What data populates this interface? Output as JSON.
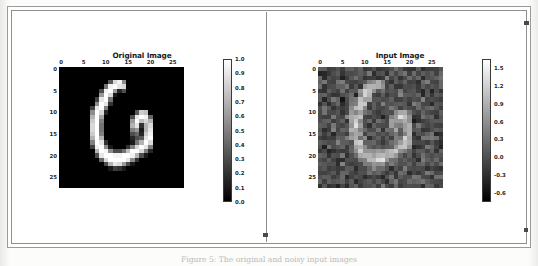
{
  "document": {
    "caption": "Figure 5: The original and noisy input images"
  },
  "figure": {
    "panels": [
      {
        "id": "original",
        "title": "Original Image",
        "xticks": [
          "0",
          "5",
          "10",
          "15",
          "20",
          "25"
        ],
        "yticks": [
          "0",
          "5",
          "10",
          "15",
          "20",
          "25"
        ],
        "colorbar": {
          "ticks": [
            "1.0",
            "0.9",
            "0.8",
            "0.7",
            "0.6",
            "0.5",
            "0.4",
            "0.3",
            "0.2",
            "0.1",
            "0.0"
          ],
          "vmin": 0.0,
          "vmax": 1.0,
          "cmap_low": "#000000",
          "cmap_high": "#ffffff"
        }
      },
      {
        "id": "input",
        "title": "Input Image",
        "xticks": [
          "0",
          "5",
          "10",
          "15",
          "20",
          "25"
        ],
        "yticks": [
          "0",
          "5",
          "10",
          "15",
          "20",
          "25"
        ],
        "colorbar": {
          "ticks": [
            "1.5",
            "1.2",
            "0.9",
            "0.6",
            "0.3",
            "0.0",
            "-0.3",
            "-0.6"
          ],
          "vmin": -0.75,
          "vmax": 1.65,
          "cmap_low": "#000000",
          "cmap_high": "#ffffff"
        }
      }
    ]
  },
  "chart_data": [
    {
      "type": "heatmap",
      "id": "original-image",
      "title": "Original Image",
      "xlabel": "",
      "ylabel": "",
      "cmap": "gray",
      "grid": false,
      "legend": "colorbar-right",
      "xlim": [
        0,
        27
      ],
      "ylim": [
        27,
        0
      ],
      "xticks": [
        0,
        5,
        10,
        15,
        20,
        25
      ],
      "yticks": [
        0,
        5,
        10,
        15,
        20,
        25
      ],
      "colorbar_ticks": [
        1.0,
        0.9,
        0.8,
        0.7,
        0.6,
        0.5,
        0.4,
        0.3,
        0.2,
        0.1,
        0.0
      ],
      "vmin": 0.0,
      "vmax": 1.0,
      "shape": [
        28,
        28
      ],
      "description": "MNIST handwritten digit 6, white strokes on black background",
      "values": [
        [
          0,
          0,
          0,
          0,
          0,
          0,
          0,
          0,
          0,
          0,
          0,
          0,
          0,
          0,
          0,
          0,
          0,
          0,
          0,
          0,
          0,
          0,
          0,
          0,
          0,
          0,
          0,
          0
        ],
        [
          0,
          0,
          0,
          0,
          0,
          0,
          0,
          0,
          0,
          0,
          0,
          0,
          0,
          0,
          0,
          0,
          0,
          0,
          0,
          0,
          0,
          0,
          0,
          0,
          0,
          0,
          0,
          0
        ],
        [
          0,
          0,
          0,
          0,
          0,
          0,
          0,
          0,
          0,
          0,
          0,
          0,
          0,
          0,
          0,
          0,
          0,
          0,
          0,
          0,
          0,
          0,
          0,
          0,
          0,
          0,
          0,
          0
        ],
        [
          0,
          0,
          0,
          0,
          0,
          0,
          0,
          0,
          0,
          0,
          0,
          0.35,
          0.85,
          0.95,
          0.55,
          0,
          0,
          0,
          0,
          0,
          0,
          0,
          0,
          0,
          0,
          0,
          0,
          0
        ],
        [
          0,
          0,
          0,
          0,
          0,
          0,
          0,
          0,
          0,
          0,
          0.45,
          0.95,
          1.0,
          0.9,
          0.85,
          0,
          0,
          0,
          0,
          0,
          0,
          0,
          0,
          0,
          0,
          0,
          0,
          0
        ],
        [
          0,
          0,
          0,
          0,
          0,
          0,
          0,
          0,
          0,
          0.3,
          0.95,
          1.0,
          0.6,
          0.15,
          0.3,
          0,
          0,
          0,
          0,
          0,
          0,
          0,
          0,
          0,
          0,
          0,
          0,
          0
        ],
        [
          0,
          0,
          0,
          0,
          0,
          0,
          0,
          0,
          0,
          0.6,
          1.0,
          0.85,
          0.1,
          0,
          0,
          0,
          0,
          0,
          0,
          0,
          0,
          0,
          0,
          0,
          0,
          0,
          0,
          0
        ],
        [
          0,
          0,
          0,
          0,
          0,
          0,
          0,
          0,
          0.25,
          0.9,
          1.0,
          0.45,
          0,
          0,
          0,
          0,
          0,
          0,
          0,
          0,
          0,
          0,
          0,
          0,
          0,
          0,
          0,
          0
        ],
        [
          0,
          0,
          0,
          0,
          0,
          0,
          0,
          0,
          0.55,
          1.0,
          0.9,
          0.2,
          0,
          0,
          0,
          0,
          0,
          0,
          0,
          0,
          0,
          0,
          0,
          0,
          0,
          0,
          0,
          0
        ],
        [
          0,
          0,
          0,
          0,
          0,
          0,
          0,
          0.25,
          0.9,
          1.0,
          0.5,
          0,
          0,
          0,
          0,
          0,
          0,
          0,
          0,
          0,
          0,
          0,
          0,
          0,
          0,
          0,
          0,
          0
        ],
        [
          0,
          0,
          0,
          0,
          0,
          0,
          0,
          0.55,
          1.0,
          0.85,
          0.15,
          0,
          0,
          0,
          0,
          0,
          0,
          0.35,
          0.8,
          0.75,
          0,
          0,
          0,
          0,
          0,
          0,
          0,
          0
        ],
        [
          0,
          0,
          0,
          0,
          0,
          0,
          0,
          0.7,
          1.0,
          0.65,
          0,
          0,
          0,
          0,
          0,
          0,
          0.3,
          0.9,
          1.0,
          0.95,
          0.4,
          0,
          0,
          0,
          0,
          0,
          0,
          0
        ],
        [
          0,
          0,
          0,
          0,
          0,
          0,
          0,
          0.8,
          1.0,
          0.5,
          0,
          0,
          0,
          0,
          0,
          0,
          0.6,
          1.0,
          0.75,
          0.85,
          0.7,
          0,
          0,
          0,
          0,
          0,
          0,
          0
        ],
        [
          0,
          0,
          0,
          0,
          0,
          0,
          0,
          0.85,
          1.0,
          0.45,
          0,
          0,
          0,
          0,
          0,
          0,
          0.7,
          0.9,
          0.2,
          0.7,
          0.85,
          0,
          0,
          0,
          0,
          0,
          0,
          0
        ],
        [
          0,
          0,
          0,
          0,
          0,
          0,
          0,
          0.85,
          1.0,
          0.45,
          0,
          0,
          0,
          0,
          0,
          0,
          0.5,
          0.6,
          0.1,
          0.7,
          0.9,
          0,
          0,
          0,
          0,
          0,
          0,
          0
        ],
        [
          0,
          0,
          0,
          0,
          0,
          0,
          0,
          0.8,
          1.0,
          0.5,
          0,
          0,
          0,
          0,
          0,
          0,
          0.3,
          0.4,
          0.15,
          0.8,
          0.95,
          0,
          0,
          0,
          0,
          0,
          0,
          0
        ],
        [
          0,
          0,
          0,
          0,
          0,
          0,
          0,
          0.7,
          1.0,
          0.7,
          0,
          0,
          0,
          0,
          0,
          0,
          0.15,
          0.3,
          0.35,
          0.9,
          1.0,
          0,
          0,
          0,
          0,
          0,
          0,
          0
        ],
        [
          0,
          0,
          0,
          0,
          0,
          0,
          0,
          0.5,
          1.0,
          0.9,
          0.2,
          0,
          0,
          0,
          0,
          0,
          0.1,
          0.45,
          0.7,
          1.0,
          0.85,
          0,
          0,
          0,
          0,
          0,
          0,
          0
        ],
        [
          0,
          0,
          0,
          0,
          0,
          0,
          0,
          0.25,
          0.95,
          1.0,
          0.55,
          0.1,
          0,
          0,
          0,
          0.2,
          0.5,
          0.85,
          1.0,
          0.9,
          0.5,
          0,
          0,
          0,
          0,
          0,
          0,
          0
        ],
        [
          0,
          0,
          0,
          0,
          0,
          0,
          0,
          0,
          0.7,
          1.0,
          0.95,
          0.55,
          0.3,
          0.3,
          0.45,
          0.75,
          1.0,
          1.0,
          0.85,
          0.5,
          0.15,
          0,
          0,
          0,
          0,
          0,
          0,
          0
        ],
        [
          0,
          0,
          0,
          0,
          0,
          0,
          0,
          0,
          0.3,
          0.9,
          1.0,
          1.0,
          0.95,
          0.95,
          1.0,
          1.0,
          0.95,
          0.7,
          0.3,
          0.1,
          0,
          0,
          0,
          0,
          0,
          0,
          0,
          0
        ],
        [
          0,
          0,
          0,
          0,
          0,
          0,
          0,
          0,
          0,
          0.4,
          0.85,
          1.0,
          1.0,
          1.0,
          1.0,
          0.9,
          0.55,
          0.2,
          0,
          0,
          0,
          0,
          0,
          0,
          0,
          0,
          0,
          0
        ],
        [
          0,
          0,
          0,
          0,
          0,
          0,
          0,
          0,
          0,
          0,
          0.3,
          0.7,
          0.9,
          0.85,
          0.6,
          0.3,
          0.1,
          0,
          0,
          0,
          0,
          0,
          0,
          0,
          0,
          0,
          0,
          0
        ],
        [
          0,
          0,
          0,
          0,
          0,
          0,
          0,
          0,
          0,
          0,
          0,
          0.1,
          0.25,
          0.2,
          0.1,
          0,
          0,
          0,
          0,
          0,
          0,
          0,
          0,
          0,
          0,
          0,
          0,
          0
        ],
        [
          0,
          0,
          0,
          0,
          0,
          0,
          0,
          0,
          0,
          0,
          0,
          0,
          0,
          0,
          0,
          0,
          0,
          0,
          0,
          0,
          0,
          0,
          0,
          0,
          0,
          0,
          0,
          0
        ],
        [
          0,
          0,
          0,
          0,
          0,
          0,
          0,
          0,
          0,
          0,
          0,
          0,
          0,
          0,
          0,
          0,
          0,
          0,
          0,
          0,
          0,
          0,
          0,
          0,
          0,
          0,
          0,
          0
        ],
        [
          0,
          0,
          0,
          0,
          0,
          0,
          0,
          0,
          0,
          0,
          0,
          0,
          0,
          0,
          0,
          0,
          0,
          0,
          0,
          0,
          0,
          0,
          0,
          0,
          0,
          0,
          0,
          0
        ],
        [
          0,
          0,
          0,
          0,
          0,
          0,
          0,
          0,
          0,
          0,
          0,
          0,
          0,
          0,
          0,
          0,
          0,
          0,
          0,
          0,
          0,
          0,
          0,
          0,
          0,
          0,
          0,
          0
        ]
      ]
    },
    {
      "type": "heatmap",
      "id": "input-image",
      "title": "Input Image",
      "xlabel": "",
      "ylabel": "",
      "cmap": "gray",
      "grid": false,
      "legend": "colorbar-right",
      "xlim": [
        0,
        27
      ],
      "ylim": [
        27,
        0
      ],
      "xticks": [
        0,
        5,
        10,
        15,
        20,
        25
      ],
      "yticks": [
        0,
        5,
        10,
        15,
        20,
        25
      ],
      "colorbar_ticks": [
        1.5,
        1.2,
        0.9,
        0.6,
        0.3,
        0.0,
        -0.3,
        -0.6
      ],
      "vmin": -0.75,
      "vmax": 1.65,
      "shape": [
        28,
        28
      ],
      "description": "Same MNIST digit 6 corrupted with additive Gaussian noise; mid-grey background speckle, digit strokes remain bright"
    }
  ]
}
